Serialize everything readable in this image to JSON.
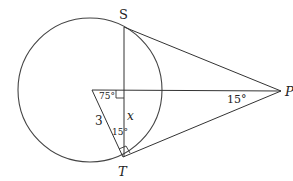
{
  "diagram": {
    "type": "geometry",
    "points": {
      "S": {
        "label": "S"
      },
      "T": {
        "label": "T"
      },
      "P": {
        "label": "P"
      }
    },
    "labels": {
      "angle_center": "75°",
      "angle_P": "15°",
      "angle_T": "15°",
      "side_radius": "3",
      "side_x": "x"
    },
    "colors": {
      "stroke": "#333333",
      "background": "#ffffff"
    }
  }
}
